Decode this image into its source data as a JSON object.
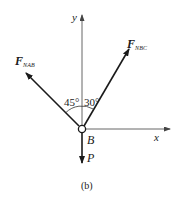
{
  "figure": {
    "caption": "(b)",
    "point_label": "B",
    "axes": {
      "x_label": "x",
      "y_label": "y"
    },
    "forces": [
      {
        "id": "F_NAB",
        "symbol": "F",
        "subscript": "NAB",
        "direction": "upper-left",
        "angle_from_y_deg": 45
      },
      {
        "id": "F_NBC",
        "symbol": "F",
        "subscript": "NBC",
        "direction": "upper-right",
        "angle_from_y_deg": 30
      },
      {
        "id": "P",
        "symbol": "P",
        "subscript": "",
        "direction": "down"
      }
    ],
    "angles": {
      "left": "45°",
      "right": "30°"
    },
    "colors": {
      "line": "#1a1a1a",
      "axis": "#555555",
      "background": "#ffffff"
    }
  }
}
